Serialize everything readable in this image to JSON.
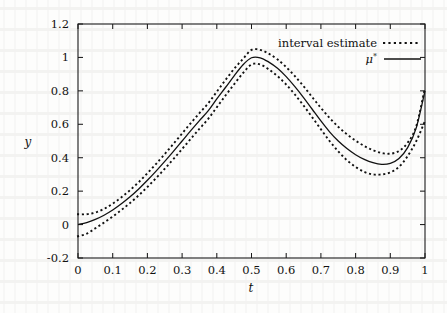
{
  "chart_data": {
    "type": "line",
    "title": "",
    "xlabel": "t",
    "ylabel": "y",
    "xlim": [
      0,
      1
    ],
    "ylim": [
      -0.2,
      1.2
    ],
    "xticks": [
      "0",
      "0.1",
      "0.2",
      "0.3",
      "0.4",
      "0.5",
      "0.6",
      "0.7",
      "0.8",
      "0.9",
      "1"
    ],
    "xtick_values": [
      0,
      0.1,
      0.2,
      0.3,
      0.4,
      0.5,
      0.6,
      0.7,
      0.8,
      0.9,
      1
    ],
    "yticks": [
      "-0.2",
      "0",
      "0.2",
      "0.4",
      "0.6",
      "0.8",
      "1",
      "1.2"
    ],
    "ytick_values": [
      -0.2,
      0,
      0.2,
      0.4,
      0.6,
      0.8,
      1,
      1.2
    ],
    "grid": false,
    "legend_position": "top-right",
    "legend": [
      {
        "label": "interval estimate",
        "style": "dotted"
      },
      {
        "label": "μ*",
        "style": "solid"
      }
    ],
    "x": [
      0,
      0.025,
      0.05,
      0.075,
      0.1,
      0.125,
      0.15,
      0.175,
      0.2,
      0.225,
      0.25,
      0.275,
      0.3,
      0.325,
      0.35,
      0.375,
      0.4,
      0.425,
      0.45,
      0.475,
      0.5,
      0.525,
      0.55,
      0.575,
      0.6,
      0.625,
      0.65,
      0.675,
      0.7,
      0.725,
      0.75,
      0.775,
      0.8,
      0.825,
      0.85,
      0.875,
      0.9,
      0.925,
      0.95,
      0.975,
      1
    ],
    "series": [
      {
        "name": "μ*",
        "style": "solid",
        "values": [
          0.0,
          0.012,
          0.031,
          0.056,
          0.087,
          0.124,
          0.166,
          0.213,
          0.265,
          0.32,
          0.378,
          0.438,
          0.5,
          0.562,
          0.622,
          0.68,
          0.752,
          0.82,
          0.89,
          0.955,
          0.998,
          0.998,
          0.972,
          0.935,
          0.885,
          0.825,
          0.76,
          0.69,
          0.62,
          0.555,
          0.5,
          0.455,
          0.418,
          0.39,
          0.37,
          0.36,
          0.366,
          0.395,
          0.46,
          0.58,
          0.8
        ]
      },
      {
        "name": "interval estimate upper",
        "style": "dotted",
        "values": [
          0.062,
          0.062,
          0.072,
          0.094,
          0.125,
          0.163,
          0.206,
          0.254,
          0.307,
          0.363,
          0.422,
          0.483,
          0.545,
          0.607,
          0.667,
          0.725,
          0.795,
          0.865,
          0.932,
          0.99,
          1.045,
          1.045,
          1.022,
          0.988,
          0.942,
          0.888,
          0.828,
          0.762,
          0.698,
          0.638,
          0.585,
          0.54,
          0.502,
          0.47,
          0.445,
          0.428,
          0.424,
          0.44,
          0.49,
          0.59,
          0.82
        ]
      },
      {
        "name": "interval estimate lower",
        "style": "dotted",
        "values": [
          -0.07,
          -0.055,
          -0.022,
          0.012,
          0.048,
          0.087,
          0.129,
          0.175,
          0.225,
          0.278,
          0.334,
          0.392,
          0.452,
          0.513,
          0.573,
          0.632,
          0.702,
          0.772,
          0.84,
          0.905,
          0.958,
          0.958,
          0.928,
          0.888,
          0.838,
          0.778,
          0.712,
          0.642,
          0.57,
          0.5,
          0.438,
          0.385,
          0.345,
          0.315,
          0.3,
          0.3,
          0.312,
          0.345,
          0.41,
          0.5,
          0.62
        ]
      }
    ]
  },
  "colors": {
    "ink": "#111111",
    "paper": "#fdfdfc"
  }
}
